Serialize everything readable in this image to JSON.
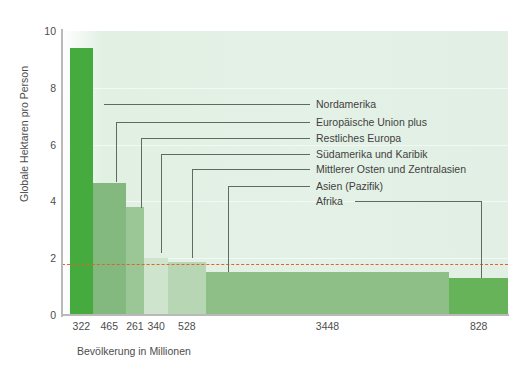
{
  "chart_data": {
    "type": "bar",
    "title": "",
    "xlabel": "Bevölkerung in Millionen",
    "ylabel": "Globale Hektaren pro Person",
    "ylim": [
      0,
      10
    ],
    "yticks": [
      0,
      2,
      4,
      6,
      8,
      10
    ],
    "grid": true,
    "legend_position": "inside-right",
    "note": "Variable-width bar chart (Marimekko style): bar width = population in millions, bar height = global hectares per person.",
    "categories": [
      "Nordamerika",
      "Europäische Union plus",
      "Restliches Europa",
      "Südamerika und Karibik",
      "Mittlerer Osten und Zentralasien",
      "Asien (Pazifik)",
      "Afrika"
    ],
    "values": [
      9.4,
      4.65,
      3.8,
      2.0,
      1.85,
      1.5,
      1.3
    ],
    "widths": [
      322,
      465,
      261,
      340,
      528,
      3448,
      828
    ],
    "xtick_labels": [
      "322",
      "465",
      "261",
      "340",
      "528",
      "3448",
      "828"
    ],
    "colors": [
      "#46ab3e",
      "#83b97e",
      "#9bc796",
      "#cfe4cd",
      "#b7d7b4",
      "#8ebf86",
      "#66b359"
    ],
    "threshold": {
      "value": 1.8,
      "color": "#e2622c",
      "style": "dashed"
    }
  },
  "axes": {
    "y_label": "Globale Hektaren pro Person",
    "x_label": "Bevölkerung in Millionen",
    "y_ticks": [
      "10",
      "8",
      "6",
      "4",
      "2",
      "0"
    ],
    "x_ticks": [
      "322",
      "465",
      "261",
      "340",
      "528",
      "3448",
      "828"
    ]
  },
  "legend": {
    "items": [
      {
        "label": "Nordamerika"
      },
      {
        "label": "Europäische Union plus"
      },
      {
        "label": "Restliches Europa"
      },
      {
        "label": "Südamerika und Karibik"
      },
      {
        "label": "Mittlerer Osten und Zentralasien"
      },
      {
        "label": "Asien (Pazifik)"
      },
      {
        "label": "Afrika"
      }
    ]
  },
  "style": {
    "plot_bg": "#e3f0e5",
    "axis_color": "#b9b9b9",
    "text_color": "#4d4d4d",
    "leader_color": "#5f6b5f"
  }
}
